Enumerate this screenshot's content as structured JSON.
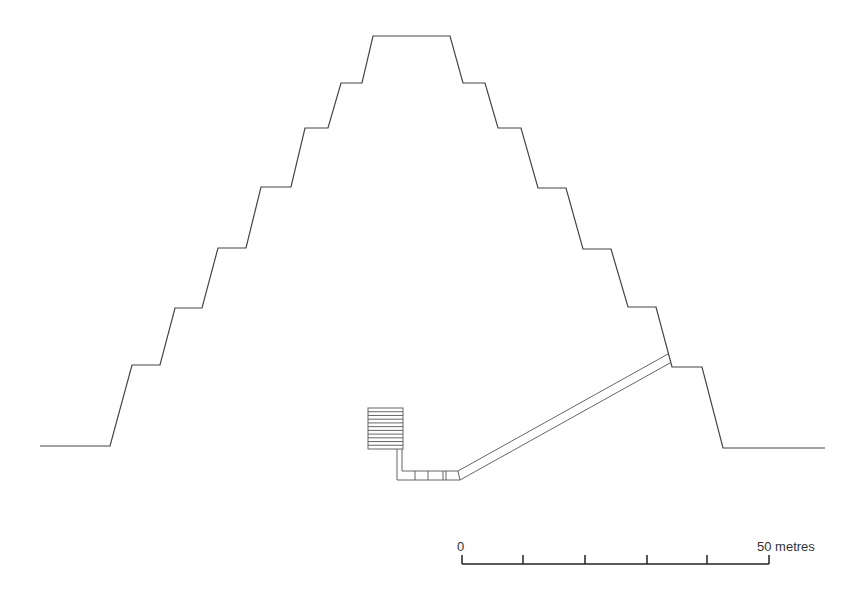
{
  "diagram": {
    "type": "cross-section",
    "pyramid_outline": [
      [
        40,
        446
      ],
      [
        110,
        446
      ],
      [
        132,
        365
      ],
      [
        160,
        365
      ],
      [
        175,
        308
      ],
      [
        202,
        308
      ],
      [
        218,
        248
      ],
      [
        246,
        248
      ],
      [
        261,
        187
      ],
      [
        291,
        187
      ],
      [
        305,
        128
      ],
      [
        328,
        128
      ],
      [
        341,
        83
      ],
      [
        362,
        83
      ],
      [
        373,
        36
      ],
      [
        450,
        36
      ],
      [
        463,
        83
      ],
      [
        485,
        83
      ],
      [
        498,
        128
      ],
      [
        521,
        128
      ],
      [
        538,
        188
      ],
      [
        566,
        188
      ],
      [
        583,
        249
      ],
      [
        611,
        249
      ],
      [
        628,
        307
      ],
      [
        656,
        307
      ],
      [
        672,
        367
      ],
      [
        702,
        367
      ],
      [
        723,
        448
      ],
      [
        825,
        448
      ]
    ],
    "corridor": {
      "upper": [
        [
          458,
          471
        ],
        [
          668,
          354
        ]
      ],
      "lower": [
        [
          460,
          480
        ],
        [
          670,
          363
        ]
      ]
    },
    "chamber": {
      "box": {
        "x": 368,
        "y": 408,
        "w": 35,
        "h": 41
      },
      "lines_count": 11
    }
  },
  "scale_bar": {
    "start_label": "0",
    "end_label": "50 metres",
    "ticks": [
      462,
      523,
      585,
      647,
      707,
      769
    ],
    "y": 564
  }
}
